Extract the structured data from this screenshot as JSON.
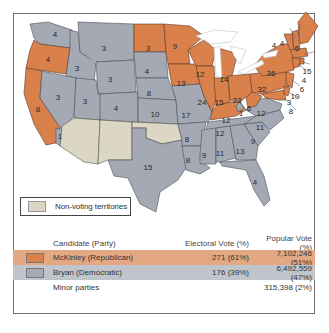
{
  "map": {
    "colors": {
      "republican": "#d9804b",
      "democratic": "#a4a9b4",
      "territory": "#dcd7c4"
    },
    "states": [
      {
        "abbr": "WA",
        "party": "democratic",
        "ev": "4"
      },
      {
        "abbr": "OR",
        "party": "republican",
        "ev": "4"
      },
      {
        "abbr": "CA",
        "party": "republican",
        "ev": "8"
      },
      {
        "abbr": "CA-split",
        "party": "democratic",
        "ev": "1"
      },
      {
        "abbr": "ID",
        "party": "democratic",
        "ev": "3"
      },
      {
        "abbr": "NV",
        "party": "democratic",
        "ev": "3"
      },
      {
        "abbr": "MT",
        "party": "democratic",
        "ev": "3"
      },
      {
        "abbr": "WY",
        "party": "democratic",
        "ev": "3"
      },
      {
        "abbr": "UT",
        "party": "democratic",
        "ev": "3"
      },
      {
        "abbr": "CO",
        "party": "democratic",
        "ev": "4"
      },
      {
        "abbr": "ND",
        "party": "republican",
        "ev": "3"
      },
      {
        "abbr": "SD",
        "party": "democratic",
        "ev": "4"
      },
      {
        "abbr": "NE",
        "party": "democratic",
        "ev": "8"
      },
      {
        "abbr": "KS",
        "party": "democratic",
        "ev": "10"
      },
      {
        "abbr": "TX",
        "party": "democratic",
        "ev": "15"
      },
      {
        "abbr": "MN",
        "party": "republican",
        "ev": "9"
      },
      {
        "abbr": "IA",
        "party": "republican",
        "ev": "13"
      },
      {
        "abbr": "MO",
        "party": "democratic",
        "ev": "17"
      },
      {
        "abbr": "AR",
        "party": "democratic",
        "ev": "8"
      },
      {
        "abbr": "LA",
        "party": "democratic",
        "ev": "8"
      },
      {
        "abbr": "WI",
        "party": "republican",
        "ev": "12"
      },
      {
        "abbr": "IL",
        "party": "republican",
        "ev": "24"
      },
      {
        "abbr": "MI",
        "party": "republican",
        "ev": "14"
      },
      {
        "abbr": "IN",
        "party": "republican",
        "ev": "15"
      },
      {
        "abbr": "OH",
        "party": "republican",
        "ev": "23"
      },
      {
        "abbr": "KY",
        "party": "republican",
        "ev": "12"
      },
      {
        "abbr": "KY-split",
        "party": "democratic",
        "ev": "1"
      },
      {
        "abbr": "TN",
        "party": "democratic",
        "ev": "12"
      },
      {
        "abbr": "MS",
        "party": "democratic",
        "ev": "9"
      },
      {
        "abbr": "AL",
        "party": "democratic",
        "ev": "11"
      },
      {
        "abbr": "GA",
        "party": "democratic",
        "ev": "13"
      },
      {
        "abbr": "FL",
        "party": "democratic",
        "ev": "4"
      },
      {
        "abbr": "SC",
        "party": "democratic",
        "ev": "9"
      },
      {
        "abbr": "NC",
        "party": "democratic",
        "ev": "11"
      },
      {
        "abbr": "VA",
        "party": "democratic",
        "ev": "12"
      },
      {
        "abbr": "WV",
        "party": "republican",
        "ev": "6"
      },
      {
        "abbr": "PA",
        "party": "republican",
        "ev": "32"
      },
      {
        "abbr": "NY",
        "party": "republican",
        "ev": "36"
      },
      {
        "abbr": "VT",
        "party": "republican",
        "ev": "4"
      },
      {
        "abbr": "NH",
        "party": "republican",
        "ev": "4"
      },
      {
        "abbr": "ME",
        "party": "republican",
        "ev": "6"
      },
      {
        "abbr": "MA",
        "party": "republican",
        "ev": "15"
      },
      {
        "abbr": "RI",
        "party": "republican",
        "ev": "4"
      },
      {
        "abbr": "CT",
        "party": "republican",
        "ev": "6"
      },
      {
        "abbr": "NJ",
        "party": "republican",
        "ev": "10"
      },
      {
        "abbr": "DE",
        "party": "republican",
        "ev": "3"
      },
      {
        "abbr": "MD",
        "party": "republican",
        "ev": "8"
      }
    ],
    "territories": [
      "AZ",
      "NM",
      "OK"
    ]
  },
  "legend": {
    "territories_label": "Non-voting territories"
  },
  "results": {
    "headers": {
      "candidate": "Candidate (Party)",
      "electoral": "Electoral Vote (%)",
      "popular": "Popular Vote (%)"
    },
    "rows": [
      {
        "candidate": "McKinley (Republican)",
        "electoral": "271 (61%)",
        "popular": "7,102,246 (51%)",
        "color": "#d9804b"
      },
      {
        "candidate": "Bryan (Democratic)",
        "electoral": "176 (39%)",
        "popular": "6,492,559 (47%)",
        "color": "#a4a9b4"
      },
      {
        "candidate": "Minor parties",
        "electoral": "",
        "popular": "315,398 (2%)"
      }
    ]
  }
}
